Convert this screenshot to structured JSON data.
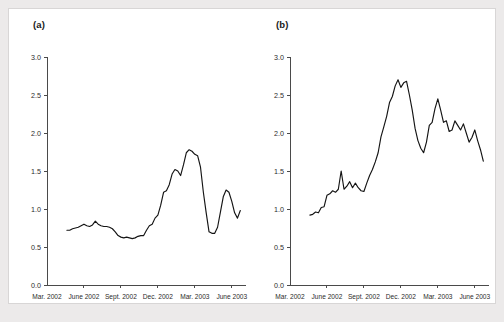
{
  "figure": {
    "background_color": "#eceaea",
    "panel_background": "#ffffff",
    "line_color": "#141414",
    "axis_color": "#4a4a4a"
  },
  "panels": [
    {
      "label": "(a)"
    },
    {
      "label": "(b)"
    }
  ],
  "chart_data": [
    {
      "type": "line",
      "title": "",
      "subtitle": "",
      "panel_label": "(a)",
      "xlabel": "",
      "ylabel": "",
      "legend": [],
      "legend_position": "none",
      "grid": false,
      "ylim": [
        0.0,
        3.0
      ],
      "ytick_labels": [
        "0.0",
        "0.5",
        "1.0",
        "1.5",
        "2.0",
        "2.5",
        "3.0"
      ],
      "yticks": [
        0.0,
        0.5,
        1.0,
        1.5,
        2.0,
        2.5,
        3.0
      ],
      "xtick_labels": [
        "Mar. 2002",
        "June 2002",
        "Sept. 2002",
        "Dec. 2002",
        "Mar. 2003",
        "June 2003"
      ],
      "xticks": [
        0,
        13,
        26,
        39,
        52,
        65
      ],
      "xlim": [
        0,
        70
      ],
      "x": [
        7,
        8,
        9,
        10,
        11,
        12,
        13,
        14,
        15,
        16,
        17,
        18,
        19,
        20,
        21,
        22,
        23,
        24,
        25,
        26,
        27,
        28,
        29,
        30,
        31,
        32,
        33,
        34,
        35,
        36,
        37,
        38,
        39,
        40,
        41,
        42,
        43,
        44,
        45,
        46,
        47,
        48,
        49,
        50,
        51,
        52,
        53,
        54,
        55,
        56,
        57,
        58,
        59,
        60,
        61,
        62,
        63,
        64,
        65,
        66,
        67,
        68
      ],
      "values": [
        0.72,
        0.72,
        0.74,
        0.75,
        0.76,
        0.78,
        0.8,
        0.78,
        0.77,
        0.79,
        0.84,
        0.8,
        0.78,
        0.77,
        0.77,
        0.76,
        0.74,
        0.7,
        0.65,
        0.63,
        0.62,
        0.63,
        0.62,
        0.61,
        0.62,
        0.64,
        0.65,
        0.65,
        0.72,
        0.78,
        0.8,
        0.88,
        0.92,
        1.05,
        1.22,
        1.24,
        1.32,
        1.46,
        1.52,
        1.5,
        1.44,
        1.58,
        1.74,
        1.78,
        1.76,
        1.72,
        1.7,
        1.55,
        1.22,
        0.95,
        0.7,
        0.68,
        0.68,
        0.76,
        0.96,
        1.16,
        1.25,
        1.22,
        1.1,
        0.95,
        0.88,
        0.98
      ]
    },
    {
      "type": "line",
      "title": "",
      "subtitle": "",
      "panel_label": "(b)",
      "xlabel": "",
      "ylabel": "",
      "legend": [],
      "legend_position": "none",
      "grid": false,
      "ylim": [
        0.0,
        3.0
      ],
      "ytick_labels": [
        "0.0",
        "0.5",
        "1.0",
        "1.5",
        "2.0",
        "2.5",
        "3.0"
      ],
      "yticks": [
        0.0,
        0.5,
        1.0,
        1.5,
        2.0,
        2.5,
        3.0
      ],
      "xtick_labels": [
        "Mar. 2002",
        "June 2002",
        "Sept. 2002",
        "Dec. 2002",
        "Mar. 2003",
        "June 2003"
      ],
      "xticks": [
        0,
        13,
        26,
        39,
        52,
        65
      ],
      "xlim": [
        0,
        70
      ],
      "x": [
        7,
        8,
        9,
        10,
        11,
        12,
        13,
        14,
        15,
        16,
        17,
        18,
        19,
        20,
        21,
        22,
        23,
        24,
        25,
        26,
        27,
        28,
        29,
        30,
        31,
        32,
        33,
        34,
        35,
        36,
        37,
        38,
        39,
        40,
        41,
        42,
        43,
        44,
        45,
        46,
        47,
        48,
        49,
        50,
        51,
        52,
        53,
        54,
        55,
        56,
        57,
        58,
        59,
        60,
        61,
        62,
        63,
        64,
        65,
        66,
        67,
        68
      ],
      "values": [
        0.92,
        0.93,
        0.96,
        0.95,
        1.02,
        1.03,
        1.18,
        1.2,
        1.24,
        1.22,
        1.26,
        1.5,
        1.26,
        1.3,
        1.36,
        1.28,
        1.34,
        1.28,
        1.24,
        1.23,
        1.34,
        1.44,
        1.52,
        1.62,
        1.74,
        1.95,
        2.08,
        2.22,
        2.4,
        2.48,
        2.62,
        2.7,
        2.6,
        2.66,
        2.68,
        2.5,
        2.3,
        2.06,
        1.9,
        1.8,
        1.74,
        1.88,
        2.1,
        2.14,
        2.32,
        2.45,
        2.3,
        2.14,
        2.16,
        2.02,
        2.04,
        2.16,
        2.1,
        2.04,
        2.12,
        2.0,
        1.88,
        1.94,
        2.04,
        1.9,
        1.78,
        1.63
      ]
    }
  ]
}
